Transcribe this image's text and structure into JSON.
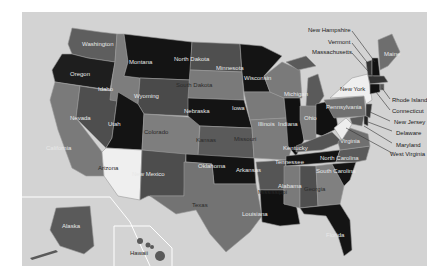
{
  "map": {
    "title": "United States",
    "background_color": "#d3d3d3",
    "state_labels": {
      "washington": "Washington",
      "oregon": "Oregon",
      "california": "California",
      "nevada": "Nevada",
      "idaho": "Idaho",
      "montana": "Montana",
      "wyoming": "Wyoming",
      "utah": "Utah",
      "arizona": "Arizona",
      "colorado": "Colorado",
      "new_mexico": "New Mexico",
      "north_dakota": "North Dakota",
      "south_dakota": "South Dakota",
      "nebraska": "Nebraska",
      "kansas": "Kansas",
      "oklahoma": "Oklahoma",
      "texas": "Texas",
      "minnesota": "Minnesota",
      "iowa": "Iowa",
      "missouri": "Missouri",
      "arkansas": "Arkansas",
      "louisiana": "Louisiana",
      "wisconsin": "Wisconsin",
      "illinois": "Illinois",
      "michigan": "Michigan",
      "indiana": "Indiana",
      "ohio": "Ohio",
      "kentucky": "Kentucky",
      "tennessee": "Tennessee",
      "mississippi": "Mississippi",
      "alabama": "Alabama",
      "georgia": "Georgia",
      "florida": "Florida",
      "south_carolina": "South Carolina",
      "north_carolina": "North Carolina",
      "virginia": "Virginia",
      "pennsylvania": "Pennsylvania",
      "new_york": "New York",
      "maine": "Maine",
      "alaska": "Alaska",
      "hawaii": "Hawaii"
    },
    "callouts": {
      "new_hampshire": "New Hampshire",
      "vermont": "Vermont",
      "massachusetts": "Massachusetts",
      "rhode_island": "Rhode Island",
      "connecticut": "Connecticut",
      "new_jersey": "New Jersey",
      "delaware": "Delaware",
      "maryland": "Maryland",
      "west_virginia": "West Virginia"
    }
  }
}
